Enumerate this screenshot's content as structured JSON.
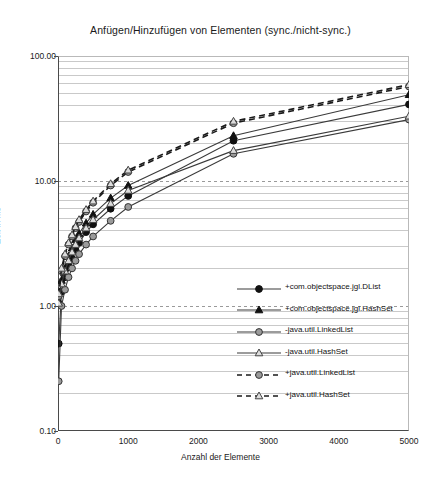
{
  "chart_data": {
    "type": "line",
    "title": "Anfügen/Hinzufügen von Elementen (sync./nicht-sync.)",
    "xlabel": "Anzahl der Elemente",
    "ylabel": "Zeit in ms",
    "xlim": [
      0,
      5000
    ],
    "ylim": [
      0.1,
      100
    ],
    "yscale": "log",
    "grid": true,
    "legend_position": "inside-lower-right",
    "xticks": [
      0,
      1000,
      2000,
      3000,
      4000,
      5000
    ],
    "xtick_labels": [
      "0",
      "1000",
      "2000",
      "3000",
      "4000",
      "5000"
    ],
    "yticks": [
      0.1,
      1,
      10,
      100
    ],
    "ytick_labels": [
      "0.10",
      "1.00",
      "10.00",
      "100.00"
    ],
    "x": [
      10,
      50,
      100,
      150,
      200,
      250,
      300,
      400,
      500,
      750,
      1000,
      2500,
      5000
    ],
    "series": [
      {
        "name": "+com.objectspace.jgl.DList",
        "marker": "filled-circle",
        "line": "solid",
        "color": "#111111",
        "values": [
          0.5,
          1.3,
          1.7,
          2.1,
          2.4,
          2.8,
          3.2,
          3.9,
          4.5,
          6.0,
          7.6,
          21.0,
          41.0
        ]
      },
      {
        "name": "+com.objectspace.jgl.HashSet",
        "marker": "filled-triangle",
        "line": "solid",
        "color": "#111111",
        "values": [
          1.1,
          1.6,
          2.0,
          2.5,
          2.9,
          3.4,
          3.8,
          4.6,
          5.4,
          7.3,
          9.2,
          23.0,
          49.0
        ]
      },
      {
        "name": "-java.util.LinkedList",
        "marker": "gray-circle",
        "line": "solid",
        "color": "#8c8c8c",
        "values": [
          0.25,
          1.0,
          1.35,
          1.7,
          2.0,
          2.3,
          2.6,
          3.1,
          3.6,
          4.8,
          6.2,
          16.5,
          31.0
        ]
      },
      {
        "name": "-java.util.HashSet",
        "marker": "open-triangle",
        "line": "solid",
        "color": "#8c8c8c",
        "values": [
          1.05,
          1.5,
          1.9,
          2.3,
          2.7,
          3.1,
          3.5,
          4.2,
          4.9,
          6.6,
          8.4,
          17.5,
          33.0
        ]
      },
      {
        "name": "+java.util.LinkedList",
        "marker": "gray-circle",
        "line": "dashed",
        "color": "#8c8c8c",
        "values": [
          1.2,
          1.9,
          2.5,
          3.1,
          3.6,
          4.2,
          4.7,
          5.7,
          6.7,
          9.2,
          11.8,
          29.0,
          57.0
        ]
      },
      {
        "name": "+java.util.HashSet",
        "marker": "open-triangle",
        "line": "dashed",
        "color": "#8c8c8c",
        "values": [
          1.25,
          2.0,
          2.6,
          3.2,
          3.7,
          4.3,
          4.9,
          5.9,
          6.9,
          9.5,
          12.2,
          30.0,
          59.0
        ]
      }
    ]
  }
}
